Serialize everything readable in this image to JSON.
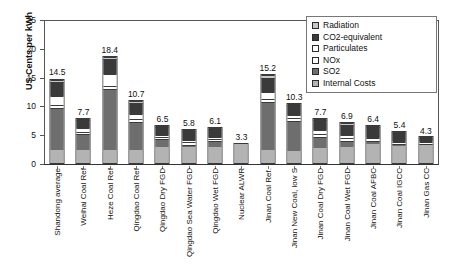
{
  "chart_data": {
    "type": "bar",
    "subtype": "stacked-vertical",
    "title": "",
    "xlabel": "",
    "ylabel": "US Cents per kWh",
    "ylim": [
      0,
      25
    ],
    "yticks": [
      0,
      5,
      10,
      15,
      20,
      25
    ],
    "grid": false,
    "legend_position": "top-right",
    "categories": [
      "Shandong average",
      "Weihai Coal Ref",
      "Heze Coal Ref",
      "Qingdao Coal Ref",
      "Qingdao Dry FGD",
      "Qingdao Sea Water FGD",
      "Qingdao Wet FGD",
      "Nuclear ALWR",
      "Jinan Coal Ref.",
      "Jinan New Coal, low S",
      "Jinan Coal Dry FGD",
      "Jinan Coal Wet FGD",
      "Jinan Coal AFBC",
      "Jinan Coal IGCC",
      "Jinan Gas CC"
    ],
    "totals": [
      14.5,
      7.7,
      18.4,
      10.7,
      6.5,
      5.8,
      6.1,
      3.3,
      15.2,
      10.3,
      7.7,
      6.9,
      6.4,
      5.4,
      4.3
    ],
    "series": [
      {
        "name": "Internal Costs",
        "color": "#b3b3b3",
        "values": [
          2.3,
          2.3,
          2.3,
          2.3,
          2.7,
          2.7,
          2.7,
          3.3,
          2.2,
          2.1,
          2.6,
          2.7,
          3.3,
          3.0,
          3.2
        ]
      },
      {
        "name": "SO2",
        "color": "#6e6e6e",
        "values": [
          7.3,
          2.7,
          10.5,
          4.9,
          1.4,
          0.5,
          1.1,
          0.0,
          8.4,
          5.2,
          1.9,
          1.1,
          0.5,
          0.3,
          0.1
        ]
      },
      {
        "name": "NOx",
        "color": "#ffffff",
        "values": [
          0.5,
          0.4,
          0.6,
          0.4,
          0.4,
          0.4,
          0.4,
          0.0,
          0.5,
          0.5,
          0.5,
          0.5,
          0.5,
          0.3,
          0.2
        ]
      },
      {
        "name": "Particulates",
        "color": "#ffffff",
        "values": [
          1.5,
          0.6,
          2.0,
          1.0,
          0.4,
          0.4,
          0.4,
          0.0,
          1.2,
          0.6,
          0.7,
          0.6,
          0.3,
          0.2,
          0.1
        ]
      },
      {
        "name": "CO2-equivalent",
        "color": "#3a3a3a",
        "values": [
          2.5,
          1.5,
          2.6,
          1.8,
          1.4,
          1.6,
          1.3,
          0.0,
          2.5,
          1.6,
          1.7,
          1.7,
          1.6,
          1.4,
          0.6
        ]
      },
      {
        "name": "Radiation",
        "color": "#c8c8c8",
        "values": [
          0.4,
          0.2,
          0.4,
          0.3,
          0.2,
          0.2,
          0.2,
          0.0,
          0.4,
          0.3,
          0.3,
          0.3,
          0.2,
          0.2,
          0.1
        ]
      }
    ]
  },
  "legend": {
    "items": [
      {
        "label": "Radiation",
        "color": "#c8c8c8"
      },
      {
        "label": "CO2-equivalent",
        "color": "#3a3a3a"
      },
      {
        "label": "Particulates",
        "color": "#ffffff"
      },
      {
        "label": "NOx",
        "color": "#ffffff"
      },
      {
        "label": "SO2",
        "color": "#6e6e6e"
      },
      {
        "label": "Internal Costs",
        "color": "#b3b3b3"
      }
    ]
  }
}
